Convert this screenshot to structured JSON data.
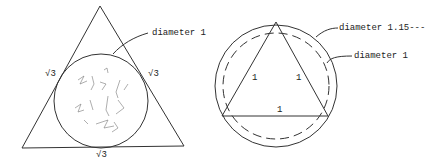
{
  "left_figure": {
    "shape": "equilateral triangle with inscribed circle",
    "side_labels": [
      "√3",
      "√3",
      "√3"
    ],
    "circle_label": "diameter 1",
    "circle_fill": "scribble"
  },
  "right_figure": {
    "shape": "equilateral triangle inscribed in circle",
    "side_labels": [
      "1",
      "1",
      "1"
    ],
    "outer_circle_label": "diameter 1.15---",
    "dashed_circle_label": "diameter 1"
  },
  "colors": {
    "line": "#333333",
    "background": "#ffffff"
  }
}
